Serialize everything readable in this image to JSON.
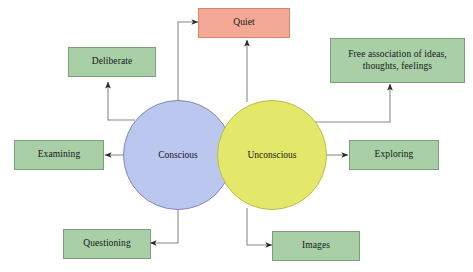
{
  "diagram": {
    "type": "concept-map",
    "background_color": "#ffffff",
    "palette": {
      "green_fill": "#a9cfa7",
      "green_stroke": "#7c9e78",
      "salmon_fill": "#f4a896",
      "salmon_stroke": "#d4846f",
      "blue_fill": "#bcc7ef",
      "blue_stroke": "#7f88bd",
      "yellow_fill": "#e4e86a",
      "yellow_stroke": "#b9bd49",
      "connector_stroke": "#8a8a8a",
      "text_color": "#15161a"
    },
    "circles": [
      {
        "id": "conscious",
        "label": "Conscious",
        "fill": "#bcc7ef",
        "cx": 178,
        "cy": 155,
        "r": 55
      },
      {
        "id": "unconscious",
        "label": "Unconscious",
        "fill": "#e4e86a",
        "cx": 272,
        "cy": 155,
        "r": 55
      }
    ],
    "boxes": [
      {
        "id": "quiet",
        "label": "Quiet",
        "fill": "#f4a896",
        "source": "both"
      },
      {
        "id": "deliberate",
        "label": "Deliberate",
        "fill": "#a9cfa7",
        "source": "conscious"
      },
      {
        "id": "free-association",
        "label": "Free association of ideas, thoughts, feelings",
        "line1": "Free association of ideas,",
        "line2": "thoughts, feelings",
        "fill": "#a9cfa7",
        "source": "unconscious"
      },
      {
        "id": "examining",
        "label": "Examining",
        "fill": "#a9cfa7",
        "source": "conscious"
      },
      {
        "id": "exploring",
        "label": "Exploring",
        "fill": "#a9cfa7",
        "source": "unconscious"
      },
      {
        "id": "questioning",
        "label": "Questioning",
        "fill": "#a9cfa7",
        "source": "conscious"
      },
      {
        "id": "images",
        "label": "Images",
        "fill": "#a9cfa7",
        "source": "unconscious"
      }
    ],
    "connectors": [
      {
        "from": "conscious",
        "to": "quiet",
        "style": "elbow",
        "arrowhead": true
      },
      {
        "from": "unconscious",
        "to": "quiet",
        "style": "straight",
        "arrowhead": true
      },
      {
        "from": "conscious",
        "to": "deliberate",
        "style": "elbow",
        "arrowhead": true
      },
      {
        "from": "conscious",
        "to": "examining",
        "style": "straight",
        "arrowhead": true
      },
      {
        "from": "conscious",
        "to": "questioning",
        "style": "elbow",
        "arrowhead": true
      },
      {
        "from": "unconscious",
        "to": "free-association",
        "style": "elbow",
        "arrowhead": true
      },
      {
        "from": "unconscious",
        "to": "exploring",
        "style": "straight",
        "arrowhead": true
      },
      {
        "from": "unconscious",
        "to": "images",
        "style": "elbow",
        "arrowhead": true
      }
    ]
  }
}
